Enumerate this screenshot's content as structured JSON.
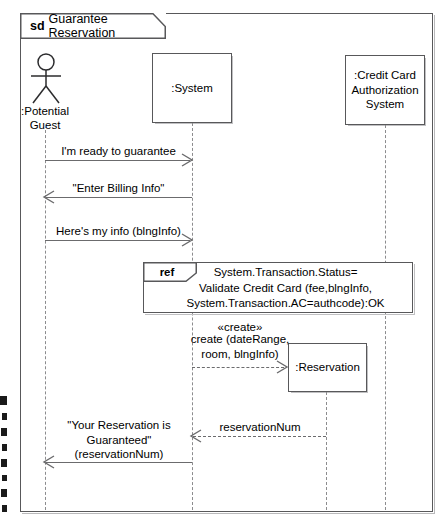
{
  "diagram": {
    "kind_label": "sd",
    "title": "Guarantee Reservation",
    "type": "uml-sequence-diagram"
  },
  "lifelines": [
    {
      "id": "potential-guest",
      "name": ":Potential\nGuest",
      "shape": "actor",
      "x": 45
    },
    {
      "id": "system",
      "name": ":System",
      "shape": "box",
      "x": 192
    },
    {
      "id": "reservation",
      "name": ":Reservation",
      "shape": "box",
      "x": 326
    },
    {
      "id": "credit-card-authorization-system",
      "name": ":Credit Card\nAuthorization\nSystem",
      "shape": "box",
      "x": 385
    }
  ],
  "messages": [
    {
      "id": "msg-ready-to-guarantee",
      "label": "I'm ready to guarantee",
      "from": "potential-guest",
      "to": "system",
      "style": "solid",
      "direction": "right"
    },
    {
      "id": "msg-enter-billing-info",
      "label": "\"Enter Billing Info\"",
      "from": "system",
      "to": "potential-guest",
      "style": "solid",
      "direction": "left"
    },
    {
      "id": "msg-heres-my-info",
      "label": "Here's my info (blngInfo)",
      "from": "potential-guest",
      "to": "system",
      "style": "solid",
      "direction": "right"
    },
    {
      "id": "msg-create-reservation",
      "stereotype": "«create»",
      "label": "create (dateRange,\nroom, blngInfo)",
      "from": "system",
      "to": "reservation",
      "style": "dashed",
      "direction": "right"
    },
    {
      "id": "msg-reservation-num",
      "label": "reservationNum",
      "from": "reservation",
      "to": "system",
      "style": "dashed",
      "direction": "left"
    },
    {
      "id": "msg-your-reservation-is-guaranteed",
      "label": "\"Your Reservation is\nGuaranteed\"\n(reservationNum)",
      "from": "system",
      "to": "potential-guest",
      "style": "solid",
      "direction": "left"
    }
  ],
  "fragments": [
    {
      "id": "ref-validate-credit-card",
      "operator": "ref",
      "body": "System.Transaction.Status=\nValidate Credit Card (fee,blngInfo,\nSystem.Transaction.AC=authcode):OK"
    }
  ],
  "colors": {
    "line": "#58585a",
    "message_line": "#6b6b6d",
    "lifeline_dash": "#8c8c8e",
    "background": "#ffffff",
    "text": "#000000"
  }
}
